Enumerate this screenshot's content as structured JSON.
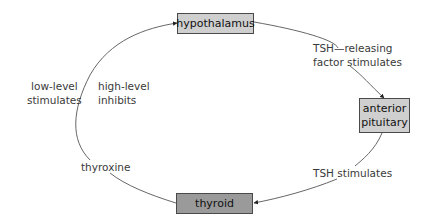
{
  "diagram": {
    "type": "feedback-loop",
    "nodes": {
      "hypothalamus": {
        "label": "hypothalamus",
        "fill": "#cfcfcf"
      },
      "pituitary": {
        "label": "anterior\npituitary",
        "fill": "#cfcfcf"
      },
      "thyroid": {
        "label": "thyroid",
        "fill": "#9a9a9a"
      }
    },
    "edges": [
      {
        "from": "hypothalamus",
        "to": "pituitary",
        "label": "TSH—releasing\nfactor stimulates"
      },
      {
        "from": "pituitary",
        "to": "thyroid",
        "label": "TSH stimulates"
      },
      {
        "from": "thyroid",
        "to": "hypothalamus",
        "label": "thyroxine"
      }
    ],
    "side_labels": {
      "outer": "low-level\nstimulates",
      "inner": "high-level\ninhibits"
    },
    "colors": {
      "line": "#555555",
      "text": "#3a3a3a",
      "box_border": "#4a4a4a"
    }
  }
}
